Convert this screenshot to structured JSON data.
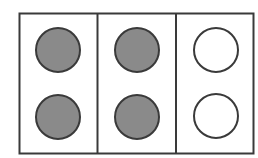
{
  "diagram": {
    "background": "#ffffff",
    "frame": {
      "x": 19.5,
      "y": 13.5,
      "width": 234,
      "height": 140,
      "stroke": "#3a3a3a",
      "stroke_width": 2
    },
    "dividers": [
      {
        "x": 97.5
      },
      {
        "x": 176
      }
    ],
    "panels": [
      {
        "id": "panel-1",
        "circles": [
          {
            "cx": 58,
            "cy": 50,
            "r": 22,
            "state": "filled",
            "fill": "#8a8a8a"
          },
          {
            "cx": 58,
            "cy": 117,
            "r": 22,
            "state": "filled",
            "fill": "#8a8a8a"
          }
        ]
      },
      {
        "id": "panel-2",
        "circles": [
          {
            "cx": 137,
            "cy": 50,
            "r": 22,
            "state": "filled",
            "fill": "#8a8a8a"
          },
          {
            "cx": 137,
            "cy": 117,
            "r": 22,
            "state": "filled",
            "fill": "#8a8a8a"
          }
        ]
      },
      {
        "id": "panel-3",
        "circles": [
          {
            "cx": 216,
            "cy": 50,
            "r": 22,
            "state": "empty",
            "fill": "#ffffff"
          },
          {
            "cx": 216,
            "cy": 116,
            "r": 22,
            "state": "empty",
            "fill": "#ffffff"
          }
        ]
      }
    ],
    "circle_stroke": "#3a3a3a",
    "circle_stroke_width": 2
  }
}
